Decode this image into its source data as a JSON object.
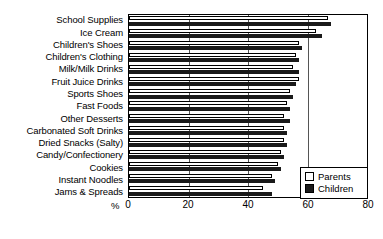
{
  "chart_data": {
    "type": "bar",
    "orientation": "horizontal",
    "title": "",
    "xlabel": "%",
    "ylabel": "",
    "xlim": [
      0,
      80
    ],
    "xticks": [
      0,
      20,
      40,
      60,
      80
    ],
    "grid": true,
    "legend_position": "bottom-right",
    "categories": [
      "School Supplies",
      "Ice Cream",
      "Children's Shoes",
      "Children's Clothing",
      "Milk/Milk Drinks",
      "Fruit Juice Drinks",
      "Sports Shoes",
      "Fast Foods",
      "Other Desserts",
      "Carbonated Soft Drinks",
      "Dried Snacks (Salty)",
      "Candy/Confectionery",
      "Cookies",
      "Instant Noodles",
      "Jams & Spreads"
    ],
    "series": [
      {
        "name": "Parents",
        "color": "#ffffff",
        "values": [
          67,
          63,
          57,
          56,
          55,
          57,
          54,
          53,
          52,
          52,
          52,
          51,
          50,
          48,
          45
        ]
      },
      {
        "name": "Children",
        "color": "#1a1a1a",
        "values": [
          68,
          65,
          58,
          57,
          57,
          56,
          55,
          54,
          54,
          53,
          53,
          52,
          51,
          49,
          48
        ]
      }
    ]
  },
  "legend": {
    "items": [
      {
        "label": "Parents",
        "swatch": "hollow-square-icon"
      },
      {
        "label": "Children",
        "swatch": "filled-square-icon"
      }
    ]
  },
  "axis": {
    "x_unit_label": "%",
    "x_tick_labels": [
      "0",
      "20",
      "40",
      "60",
      "80"
    ]
  }
}
